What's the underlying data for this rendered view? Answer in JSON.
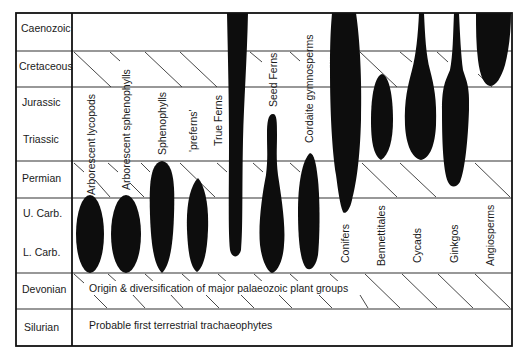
{
  "diagram": {
    "periods": [
      {
        "label": "Caenozoic",
        "hatched": false
      },
      {
        "label": "Cretaceous",
        "hatched": true
      },
      {
        "label": "Jurassic",
        "hatched": false
      },
      {
        "label": "Triassic",
        "hatched": false
      },
      {
        "label": "Permian",
        "hatched": true
      },
      {
        "label": "U. Carb.",
        "hatched": false
      },
      {
        "label": "L. Carb.",
        "hatched": false
      },
      {
        "label": "Devonian",
        "hatched": true
      },
      {
        "label": "Silurian",
        "hatched": false
      }
    ],
    "bands": {
      "devonian": "Origin & diversification of major palaeozoic plant groups",
      "silurian": "Probable first terrestrial trachaeophytes"
    },
    "groups": [
      {
        "label": "Arborescent lycopods",
        "range": "U. Carb. – L. Carb."
      },
      {
        "label": "Arborescent sphenophylls",
        "range": "U. Carb. – L. Carb."
      },
      {
        "label": "Sphenophylls",
        "range": "Permian – L. Carb."
      },
      {
        "label": "'preferns'",
        "range": "Permian – L. Carb."
      },
      {
        "label": "True Ferns",
        "range": "Caenozoic – L. Carb."
      },
      {
        "label": "Seed Ferns",
        "range": "Triassic – L. Carb."
      },
      {
        "label": "Cordaite gymnosperms",
        "range": "Permian – L. Carb."
      },
      {
        "label": "Conifers",
        "range": "Caenozoic – U. Carb."
      },
      {
        "label": "Bennettitales",
        "range": "Cretaceous – Triassic"
      },
      {
        "label": "Cycads",
        "range": "Caenozoic – Triassic"
      },
      {
        "label": "Ginkgos",
        "range": "Caenozoic – Permian"
      },
      {
        "label": "Angiosperms",
        "range": "Caenozoic – Cretaceous"
      }
    ],
    "colors": {
      "ink": "#0d0d0d",
      "background": "#ffffff",
      "lines": "#333333"
    }
  }
}
